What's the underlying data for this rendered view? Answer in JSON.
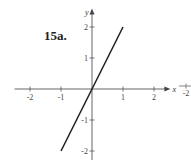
{
  "problem_label": "15a.",
  "chart_data": {
    "type": "line",
    "title": "",
    "xlabel": "x",
    "ylabel": "y",
    "xlim": [
      -2.5,
      2.4
    ],
    "ylim": [
      -2.3,
      2.5
    ],
    "grid": false,
    "xticks": [
      -2,
      -1,
      1,
      2
    ],
    "yticks": [
      -2,
      -1,
      1,
      2
    ],
    "xtick_labels": [
      "-2",
      "-1",
      "1",
      "2"
    ],
    "ytick_labels": [
      "-2",
      "-1",
      "1",
      "2"
    ],
    "series": [
      {
        "name": "y = 2x",
        "x": [
          -1,
          1
        ],
        "y": [
          -2,
          2
        ],
        "color": "#222222"
      }
    ],
    "fragment_right_edge": {
      "tick_label": "-2"
    }
  }
}
